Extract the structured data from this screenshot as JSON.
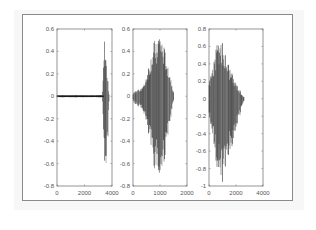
{
  "chart_data": [
    {
      "type": "line",
      "title": "",
      "xlabel": "",
      "ylabel": "",
      "xlim": [
        0,
        4000
      ],
      "ylim": [
        -0.8,
        0.6
      ],
      "xticks": [
        "0",
        "2000",
        "4000"
      ],
      "yticks": [
        "0.6",
        "0.4",
        "0.2",
        "0",
        "-0.2",
        "-0.4",
        "-0.6",
        "-0.8"
      ],
      "description": "Waveform: near-zero signal with small oscillation from 0 to ~3400, then a burst from ~3400 to ~3800",
      "envelope": [
        {
          "x": 0,
          "max": 0.01,
          "min": -0.01
        },
        {
          "x": 3300,
          "max": 0.01,
          "min": -0.01
        },
        {
          "x": 3450,
          "max": 0.52,
          "min": -0.6
        },
        {
          "x": 3550,
          "max": 0.4,
          "min": -0.73
        },
        {
          "x": 3700,
          "max": 0.15,
          "min": -0.4
        },
        {
          "x": 3800,
          "max": 0.0,
          "min": 0.0
        }
      ],
      "grid": false
    },
    {
      "type": "line",
      "title": "",
      "xlabel": "",
      "ylabel": "",
      "xlim": [
        0,
        2000
      ],
      "ylim": [
        -0.8,
        0.6
      ],
      "xticks": [
        "0",
        "1000",
        "2000"
      ],
      "yticks": [
        "0.6",
        "0.4",
        "0.2",
        "0",
        "-0.2",
        "-0.4",
        "-0.6",
        "-0.8"
      ],
      "description": "Waveform: oscillation building from ~0 to peak near 1000, then decaying to ~1500",
      "envelope": [
        {
          "x": 0,
          "max": 0.03,
          "min": -0.05
        },
        {
          "x": 400,
          "max": 0.1,
          "min": -0.15
        },
        {
          "x": 800,
          "max": 0.5,
          "min": -0.65
        },
        {
          "x": 1000,
          "max": 0.58,
          "min": -0.78
        },
        {
          "x": 1300,
          "max": 0.3,
          "min": -0.4
        },
        {
          "x": 1500,
          "max": 0.05,
          "min": -0.05
        }
      ],
      "grid": false
    },
    {
      "type": "line",
      "title": "",
      "xlabel": "",
      "ylabel": "",
      "xlim": [
        0,
        4000
      ],
      "ylim": [
        -1,
        0.8
      ],
      "xticks": [
        "0",
        "2000",
        "4000"
      ],
      "yticks": [
        "0.8",
        "0.6",
        "0.4",
        "0.2",
        "0",
        "-0.2",
        "-0.4",
        "-0.6",
        "-0.8",
        "-1"
      ],
      "description": "Waveform: dense burst starting at 0, peak near 800-1000, decaying to ~2600",
      "envelope": [
        {
          "x": 0,
          "max": 0.2,
          "min": -0.2
        },
        {
          "x": 700,
          "max": 0.7,
          "min": -0.9
        },
        {
          "x": 1000,
          "max": 0.65,
          "min": -0.97
        },
        {
          "x": 1800,
          "max": 0.25,
          "min": -0.5
        },
        {
          "x": 2600,
          "max": 0.02,
          "min": -0.02
        }
      ],
      "grid": false
    }
  ],
  "axes": [
    {
      "x_tick_labels": [
        "0",
        "2000",
        "4000"
      ],
      "y_tick_labels": [
        "0.6",
        "0.4",
        "0.2",
        "0",
        "-0.2",
        "-0.4",
        "-0.6",
        "-0.8"
      ]
    },
    {
      "x_tick_labels": [
        "0",
        "1000",
        "2000"
      ],
      "y_tick_labels": [
        "0.6",
        "0.4",
        "0.2",
        "0",
        "-0.2",
        "-0.4",
        "-0.6",
        "-0.8"
      ]
    },
    {
      "x_tick_labels": [
        "0",
        "2000",
        "4000"
      ],
      "y_tick_labels": [
        "0.8",
        "0.6",
        "0.4",
        "0.2",
        "0",
        "-0.2",
        "-0.4",
        "-0.6",
        "-0.8",
        "-1"
      ]
    }
  ],
  "colors": {
    "line": "#1a1a1a",
    "axis": "#7a7a7a",
    "frame": "#8a8a8a",
    "tick_label": "#555555"
  }
}
